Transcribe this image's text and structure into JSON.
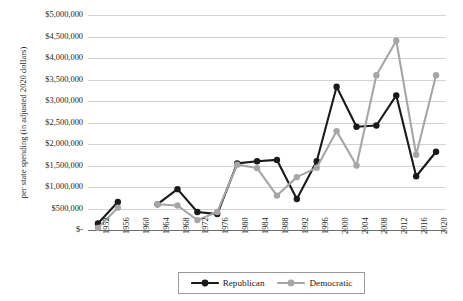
{
  "chart_data": {
    "type": "line",
    "title": "",
    "xlabel": "",
    "ylabel": "per state spending (in adjusted 2020 dollars)",
    "ylim": [
      0,
      5000000
    ],
    "ytick_labels": [
      "$5,000,000",
      "$4,500,000",
      "$4,000,000",
      "$3,500,000",
      "$3,000,000",
      "$2,500,000",
      "$2,000,000",
      "$1,500,000",
      "$1,000,000",
      "$500,000",
      "$-"
    ],
    "ytick_values": [
      5000000,
      4500000,
      4000000,
      3500000,
      3000000,
      2500000,
      2000000,
      1500000,
      1000000,
      500000,
      0
    ],
    "grid": true,
    "legend_position": "bottom",
    "categories": [
      "1952",
      "1956",
      "1960",
      "1964",
      "1968",
      "1972",
      "1976",
      "1980",
      "1984",
      "1988",
      "1992",
      "1996",
      "2000",
      "2004",
      "2008",
      "2012",
      "2016",
      "2020"
    ],
    "series": [
      {
        "name": "Republican",
        "color": "#1a1a1a",
        "values": [
          150000,
          650000,
          null,
          600000,
          950000,
          420000,
          370000,
          1550000,
          1600000,
          1630000,
          720000,
          1600000,
          3330000,
          2400000,
          2430000,
          3130000,
          1250000,
          1820000
        ]
      },
      {
        "name": "Democratic",
        "color": "#a6a6a6",
        "values": [
          50000,
          520000,
          null,
          600000,
          570000,
          230000,
          420000,
          1520000,
          1440000,
          800000,
          1230000,
          1450000,
          2300000,
          1500000,
          3600000,
          4400000,
          1750000,
          3600000
        ]
      }
    ]
  },
  "legend": {
    "items": [
      {
        "label": "Republican",
        "color": "#1a1a1a"
      },
      {
        "label": "Democratic",
        "color": "#a6a6a6"
      }
    ]
  }
}
